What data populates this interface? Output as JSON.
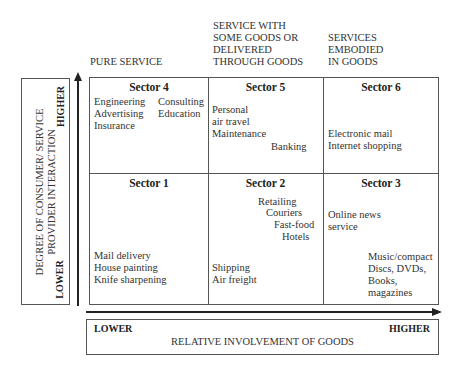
{
  "column_headers": [
    {
      "lines": [
        "PURE SERVICE"
      ]
    },
    {
      "lines": [
        "SERVICE WITH",
        "SOME GOODS OR",
        "DELIVERED",
        "THROUGH GOODS"
      ]
    },
    {
      "lines": [
        "SERVICES",
        "EMBODIED",
        "IN GOODS"
      ]
    }
  ],
  "y_axis": {
    "label_line1": "DEGREE OF CONSUMER/ SERVICE",
    "label_line2": "PROVIDER INTERACTION",
    "high": "HIGHER",
    "low": "LOWER"
  },
  "x_axis": {
    "label": "RELATIVE INVOLVEMENT OF GOODS",
    "low": "LOWER",
    "high": "HIGHER"
  },
  "sectors": {
    "s4": {
      "title": "Sector 4",
      "items": [
        "Engineering",
        "Advertising",
        "Insurance",
        "Consulting",
        "Education"
      ]
    },
    "s5": {
      "title": "Sector 5",
      "items": [
        "Personal",
        "air travel",
        "Maintenance",
        "Banking"
      ]
    },
    "s6": {
      "title": "Sector 6",
      "items": [
        "Electronic mail",
        "Internet shopping"
      ]
    },
    "s1": {
      "title": "Sector 1",
      "items": [
        "Mail delivery",
        "House painting",
        "Knife sharpening"
      ]
    },
    "s2": {
      "title": "Sector 2",
      "items": [
        "Retailing",
        "Couriers",
        "Fast-food",
        "Hotels",
        "Shipping",
        "Air freight"
      ]
    },
    "s3": {
      "title": "Sector 3",
      "items": [
        "Online news",
        "service",
        "Music/compact",
        "Discs, DVDs,",
        "Books,",
        "magazines"
      ]
    }
  },
  "colors": {
    "line": "#555555",
    "text": "#333333"
  }
}
